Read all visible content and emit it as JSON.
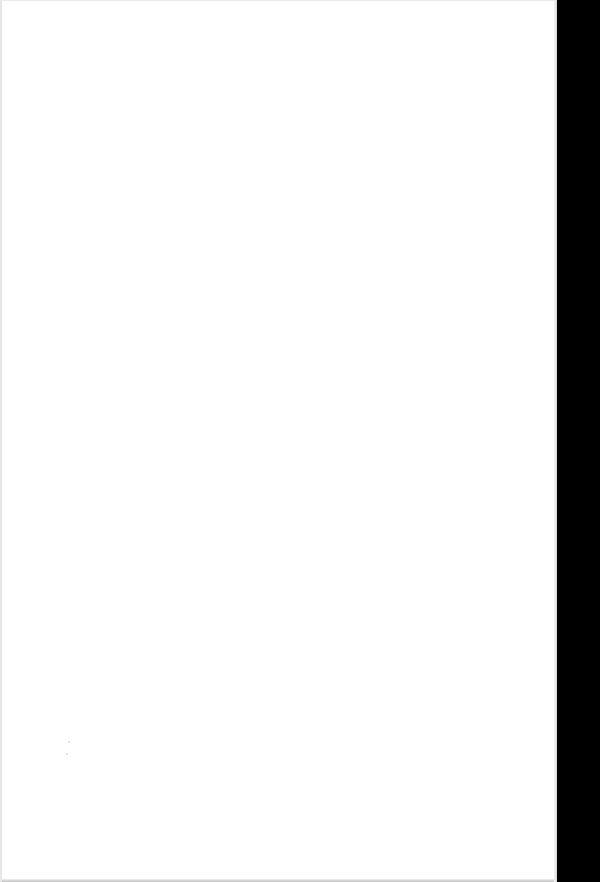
{
  "document": {
    "type": "blank scanned page",
    "page_color": "#ffffff",
    "margin_color": "#000000",
    "text": ""
  }
}
